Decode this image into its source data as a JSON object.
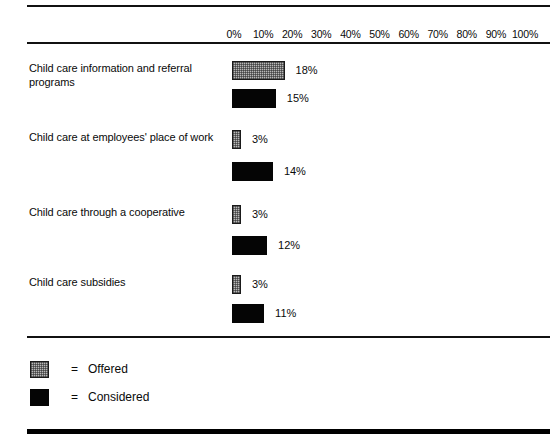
{
  "figure": {
    "background": "#ffffff",
    "ink": "#0a0a0a",
    "offered_color": "#b9b9b9",
    "considered_color": "#050505"
  },
  "axis": {
    "ticks": [
      "0%",
      "10%",
      "20%",
      "30%",
      "40%",
      "50%",
      "60%",
      "70%",
      "80%",
      "90%",
      "100%"
    ]
  },
  "groups": [
    {
      "label": "Child care information and referral programs",
      "offered": {
        "value": 18,
        "label": "18%"
      },
      "considered": {
        "value": 15,
        "label": "15%"
      }
    },
    {
      "label": "Child care at employees' place of work",
      "offered": {
        "value": 3,
        "label": "3%"
      },
      "considered": {
        "value": 14,
        "label": "14%"
      }
    },
    {
      "label": "Child care through a cooperative",
      "offered": {
        "value": 3,
        "label": "3%"
      },
      "considered": {
        "value": 12,
        "label": "12%"
      }
    },
    {
      "label": "Child care subsidies",
      "offered": {
        "value": 3,
        "label": "3%"
      },
      "considered": {
        "value": 11,
        "label": "11%"
      }
    }
  ],
  "legend": {
    "equals": "=",
    "offered_label": "Offered",
    "considered_label": "Considered"
  },
  "chart_data": {
    "type": "bar",
    "orientation": "horizontal",
    "title": "",
    "xlabel": "",
    "ylabel": "",
    "xlim": [
      0,
      100
    ],
    "grid": false,
    "legend_position": "bottom-left",
    "categories": [
      "Child care information and referral programs",
      "Child care at employees' place of work",
      "Child care through a cooperative",
      "Child care subsidies"
    ],
    "series": [
      {
        "name": "Offered",
        "values": [
          18,
          3,
          3,
          3
        ],
        "color": "#b9b9b9"
      },
      {
        "name": "Considered",
        "values": [
          15,
          14,
          12,
          11
        ],
        "color": "#050505"
      }
    ],
    "data_labels": [
      [
        "18%",
        "3%",
        "3%",
        "3%"
      ],
      [
        "15%",
        "14%",
        "12%",
        "11%"
      ]
    ],
    "tick_labels": [
      "0%",
      "10%",
      "20%",
      "30%",
      "40%",
      "50%",
      "60%",
      "70%",
      "80%",
      "90%",
      "100%"
    ]
  }
}
